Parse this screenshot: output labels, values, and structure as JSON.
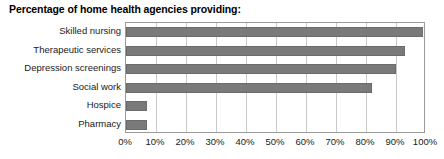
{
  "chart_data": {
    "type": "bar",
    "orientation": "horizontal",
    "title": "Percentage of home health agencies providing:",
    "xlabel": "",
    "ylabel": "",
    "categories": [
      "Skilled nursing",
      "Therapeutic services",
      "Depression screenings",
      "Social work",
      "Hospice",
      "Pharmacy"
    ],
    "values": [
      99,
      93,
      90,
      82,
      7,
      7
    ],
    "xlim": [
      0,
      100
    ],
    "xticks": [
      0,
      10,
      20,
      30,
      40,
      50,
      60,
      70,
      80,
      90,
      100
    ],
    "xtick_labels": [
      "0%",
      "10%",
      "20%",
      "30%",
      "40%",
      "50%",
      "60%",
      "70%",
      "80%",
      "90%",
      "100%"
    ],
    "grid": true,
    "grid_axis": "x",
    "legend": false,
    "bar_color": "#7a7a7a",
    "grid_color": "#c9c9c9",
    "axis_color": "#9a9a9a"
  }
}
